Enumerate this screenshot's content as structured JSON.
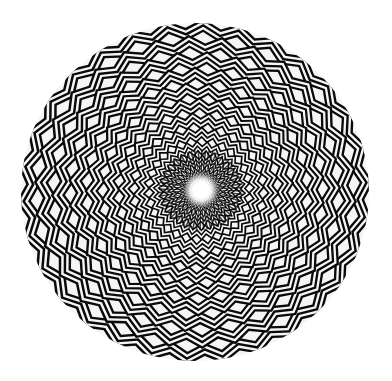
{
  "artwork": {
    "description": "Op-art concentric zigzag circle with bright center",
    "colors": {
      "background": "#ffffff",
      "stripe_dark": "#0a0a0a",
      "stripe_light": "#f5f5f5",
      "center_glow": "#ffffff"
    },
    "outer_ellipse": {
      "cx": 195,
      "cy": 192,
      "rx": 174,
      "ry": 169
    },
    "center": {
      "cx": 201,
      "cy": 190,
      "r": 9
    },
    "rings": 12,
    "teeth": 30,
    "stripes_per_ring": 6
  }
}
